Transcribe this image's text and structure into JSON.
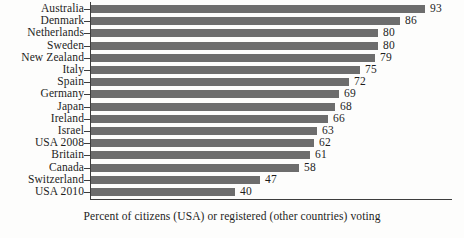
{
  "chart_data": {
    "type": "bar",
    "orientation": "horizontal",
    "title": "",
    "subtitle": "",
    "xlabel": "Percent of citizens (USA) or registered (other countries) voting",
    "ylabel": "",
    "xlim": [
      0,
      100
    ],
    "grid": false,
    "legend": null,
    "bar_color": "#6d6d6d",
    "axis_color": "#3d3d3d",
    "text_color": "#1d1d1d",
    "categories": [
      "Australia",
      "Denmark",
      "Netherlands",
      "Sweden",
      "New Zealand",
      "Italy",
      "Spain",
      "Germany",
      "Japan",
      "Ireland",
      "Israel",
      "USA 2008",
      "Britain",
      "Canada",
      "Switzerland",
      "USA 2010"
    ],
    "values": [
      93,
      86,
      80,
      80,
      79,
      75,
      72,
      69,
      68,
      66,
      63,
      62,
      61,
      58,
      47,
      40
    ],
    "value_labels": [
      "93",
      "86",
      "80",
      "80",
      "79",
      "75",
      "72",
      "69",
      "68",
      "66",
      "63",
      "62",
      "61",
      "58",
      "47",
      "40"
    ]
  },
  "caption": {
    "text": "Percent of citizens (USA) or registered (other countries) voting"
  }
}
